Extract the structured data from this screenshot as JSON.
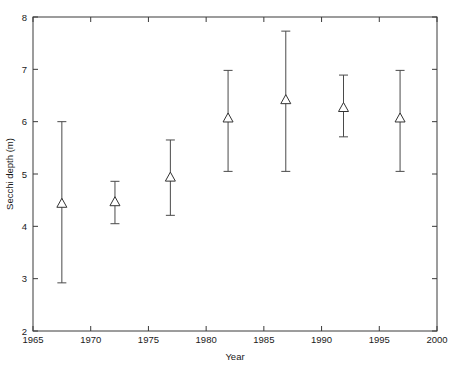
{
  "chart_data": {
    "type": "scatter",
    "title": "",
    "xlabel": "Year",
    "ylabel": "Secchi depth (m)",
    "xlim": [
      1965,
      2000
    ],
    "ylim": [
      2,
      8
    ],
    "xticks": [
      1965,
      1970,
      1975,
      1980,
      1985,
      1990,
      1995,
      2000
    ],
    "xtick_labels": [
      "1965",
      "1970",
      "1975",
      "1980",
      "1985",
      "1990",
      "1995",
      "2000"
    ],
    "yticks": [
      2,
      3,
      4,
      5,
      6,
      7,
      8
    ],
    "ytick_labels": [
      "2",
      "3",
      "4",
      "5",
      "6",
      "7",
      "8"
    ],
    "grid": false,
    "legend": null,
    "marker": "open-triangle-up",
    "error_style": "vertical-error-bars-with-caps",
    "x": [
      1967.5,
      1972.1,
      1976.9,
      1981.9,
      1986.9,
      1991.9,
      1996.8
    ],
    "values": [
      4.45,
      4.48,
      4.95,
      6.08,
      6.43,
      6.28,
      6.08
    ],
    "error_low": [
      2.92,
      4.05,
      4.21,
      5.05,
      5.05,
      5.71,
      5.05
    ],
    "error_high": [
      6.0,
      4.86,
      5.65,
      6.98,
      7.73,
      6.89,
      6.98
    ],
    "points": [
      {
        "year": 1967.5,
        "depth": 4.45,
        "low": 2.92,
        "high": 6.0
      },
      {
        "year": 1972.1,
        "depth": 4.48,
        "low": 4.05,
        "high": 4.86
      },
      {
        "year": 1976.9,
        "depth": 4.95,
        "low": 4.21,
        "high": 5.65
      },
      {
        "year": 1981.9,
        "depth": 6.08,
        "low": 5.05,
        "high": 6.98
      },
      {
        "year": 1986.9,
        "depth": 6.43,
        "low": 5.05,
        "high": 7.73
      },
      {
        "year": 1991.9,
        "depth": 6.28,
        "low": 5.71,
        "high": 6.89
      },
      {
        "year": 1996.8,
        "depth": 6.08,
        "low": 5.05,
        "high": 6.98
      }
    ],
    "colors": {
      "axis": "#3a3a3a",
      "errorbar": "#4a4a4a",
      "marker_edge": "#333333",
      "marker_face": "#ffffff",
      "background": "#ffffff"
    }
  }
}
